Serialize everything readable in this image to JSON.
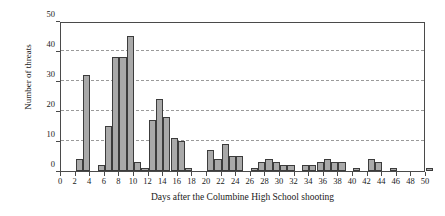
{
  "chart_data": {
    "type": "bar",
    "title": "",
    "subtitle": "",
    "xlabel": "Days after the Columbine High School shooting",
    "ylabel": "Number of threats",
    "xlim": [
      0,
      50
    ],
    "ylim": [
      0,
      50
    ],
    "xticks": [
      0,
      2,
      4,
      6,
      8,
      10,
      12,
      14,
      16,
      18,
      20,
      22,
      24,
      26,
      28,
      30,
      32,
      34,
      36,
      38,
      40,
      42,
      44,
      46,
      48,
      50
    ],
    "yticks": [
      0,
      10,
      20,
      30,
      40,
      50
    ],
    "gridlines": [
      10,
      20,
      30,
      40
    ],
    "grid": "horizontal-dashed",
    "legend": "none",
    "bin_width": 1,
    "bar_color": "#a9a9a9",
    "bar_edge_color": "#3c3c3c",
    "axis_color": "#4a4a4a",
    "grid_color": "#9a9a9a",
    "categories": [
      2,
      3,
      5,
      6,
      7,
      8,
      9,
      10,
      11,
      12,
      13,
      14,
      15,
      16,
      17,
      20,
      21,
      22,
      23,
      24,
      26,
      27,
      28,
      29,
      30,
      31,
      33,
      34,
      35,
      36,
      37,
      38,
      40,
      42,
      43,
      45,
      50
    ],
    "values": [
      4,
      32,
      2,
      15,
      38,
      38,
      45,
      3,
      1,
      17,
      24,
      18,
      11,
      10,
      1,
      7,
      4,
      9,
      5,
      5,
      1,
      3,
      4,
      3,
      2,
      2,
      2,
      2,
      3,
      4,
      3,
      3,
      1,
      4,
      3,
      1,
      1
    ]
  }
}
